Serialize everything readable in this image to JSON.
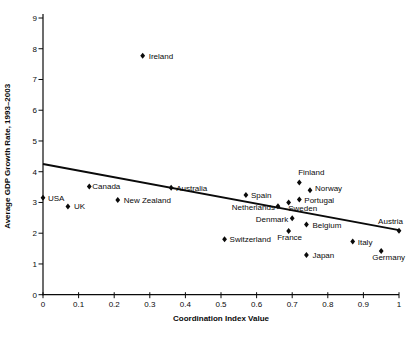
{
  "figure": {
    "background": "#ffffff",
    "ink": "#0a0a0a",
    "marker_shape": "diamond"
  },
  "chart_data": {
    "type": "scatter",
    "title": "",
    "xlabel": "Coordination Index Value",
    "ylabel": "Average GDP Growth Rate, 1993–2003",
    "xlim": [
      0,
      1
    ],
    "ylim": [
      0,
      9
    ],
    "grid": false,
    "legend": "none",
    "x_ticks": [
      {
        "value": 0,
        "label": "0"
      },
      {
        "value": 0.1,
        "label": "0.1"
      },
      {
        "value": 0.2,
        "label": "0.2"
      },
      {
        "value": 0.3,
        "label": "0.3"
      },
      {
        "value": 0.4,
        "label": "0.4"
      },
      {
        "value": 0.5,
        "label": "0.5"
      },
      {
        "value": 0.6,
        "label": "0.6"
      },
      {
        "value": 0.7,
        "label": "0.7"
      },
      {
        "value": 0.8,
        "label": "0.8"
      },
      {
        "value": 0.9,
        "label": "0.9"
      },
      {
        "value": 1,
        "label": "1"
      }
    ],
    "y_ticks": [
      {
        "value": 0,
        "label": "0"
      },
      {
        "value": 1,
        "label": "1"
      },
      {
        "value": 2,
        "label": "2"
      },
      {
        "value": 3,
        "label": "3"
      },
      {
        "value": 4,
        "label": "4"
      },
      {
        "value": 5,
        "label": "5"
      },
      {
        "value": 6,
        "label": "6"
      },
      {
        "value": 7,
        "label": "7"
      },
      {
        "value": 8,
        "label": "8"
      },
      {
        "value": 9,
        "label": "9"
      }
    ],
    "points": [
      {
        "name": "USA",
        "x": 0.0,
        "y": 3.15,
        "label": {
          "anchor": "start",
          "dx": 5,
          "dy": 3
        }
      },
      {
        "name": "UK",
        "x": 0.07,
        "y": 2.87,
        "label": {
          "anchor": "start",
          "dx": 6,
          "dy": 3
        }
      },
      {
        "name": "Canada",
        "x": 0.13,
        "y": 3.52,
        "label": {
          "anchor": "start",
          "dx": 3,
          "dy": 3
        }
      },
      {
        "name": "New Zealand",
        "x": 0.21,
        "y": 3.08,
        "label": {
          "anchor": "start",
          "dx": 6,
          "dy": 3
        }
      },
      {
        "name": "Ireland",
        "x": 0.28,
        "y": 7.77,
        "label": {
          "anchor": "start",
          "dx": 6,
          "dy": 3
        }
      },
      {
        "name": "Australia",
        "x": 0.36,
        "y": 3.48,
        "label": {
          "anchor": "start",
          "dx": 5,
          "dy": 3
        }
      },
      {
        "name": "Switzerland",
        "x": 0.51,
        "y": 1.8,
        "label": {
          "anchor": "start",
          "dx": 5,
          "dy": 3
        }
      },
      {
        "name": "Spain",
        "x": 0.57,
        "y": 3.24,
        "label": {
          "anchor": "start",
          "dx": 5,
          "dy": 3
        }
      },
      {
        "name": "Netherlands",
        "x": 0.66,
        "y": 2.88,
        "label": {
          "anchor": "end",
          "dx": -3,
          "dy": 4
        }
      },
      {
        "name": "Sweden",
        "x": 0.69,
        "y": 3.0,
        "label": {
          "anchor": "middle",
          "dx": 14,
          "dy": 9
        }
      },
      {
        "name": "France",
        "x": 0.69,
        "y": 2.07,
        "label": {
          "anchor": "middle",
          "dx": 1,
          "dy": 9
        }
      },
      {
        "name": "Denmark",
        "x": 0.7,
        "y": 2.49,
        "label": {
          "anchor": "end",
          "dx": -4,
          "dy": 4
        }
      },
      {
        "name": "Finland",
        "x": 0.72,
        "y": 3.65,
        "label": {
          "anchor": "middle",
          "dx": 12,
          "dy": -7
        }
      },
      {
        "name": "Portugal",
        "x": 0.72,
        "y": 3.1,
        "label": {
          "anchor": "start",
          "dx": 5,
          "dy": 4
        }
      },
      {
        "name": "Belgium",
        "x": 0.74,
        "y": 2.28,
        "label": {
          "anchor": "start",
          "dx": 6,
          "dy": 3
        }
      },
      {
        "name": "Japan",
        "x": 0.74,
        "y": 1.29,
        "label": {
          "anchor": "start",
          "dx": 6,
          "dy": 3
        }
      },
      {
        "name": "Norway",
        "x": 0.75,
        "y": 3.4,
        "label": {
          "anchor": "start",
          "dx": 5,
          "dy": 1
        }
      },
      {
        "name": "Italy",
        "x": 0.87,
        "y": 1.73,
        "label": {
          "anchor": "start",
          "dx": 5,
          "dy": 3
        }
      },
      {
        "name": "Germany",
        "x": 0.95,
        "y": 1.42,
        "label": {
          "anchor": "start",
          "dx": -9,
          "dy": 9
        }
      },
      {
        "name": "Austria",
        "x": 1.0,
        "y": 2.08,
        "label": {
          "anchor": "end",
          "dx": 4,
          "dy": -7
        }
      }
    ],
    "trend_line": {
      "x1": 0,
      "y1": 4.25,
      "x2": 1,
      "y2": 2.1
    }
  }
}
